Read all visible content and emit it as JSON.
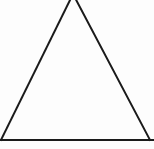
{
  "figure": {
    "kind": "geometry-diagram",
    "background_color": "#fdfdfd",
    "stroke_color": "#1a1a1a",
    "stroke_width": 2,
    "canvas": {
      "width": 154,
      "height": 149
    },
    "shapes": {
      "triangle": {
        "name": "isosceles-triangle",
        "apex": {
          "x": 73,
          "y": -6
        },
        "bottom_left": {
          "x": 1,
          "y": 140
        },
        "bottom_right": {
          "x": 150,
          "y": 140
        },
        "apex_clipped_at_top": true
      },
      "baseline": {
        "name": "horizontal-base-rule",
        "x1": 0,
        "y1": 140,
        "x2": 154,
        "y2": 140,
        "thickness": 2
      }
    },
    "margin_mark": {
      "name": "clipped-margin-glyph",
      "text": ",",
      "x": 0,
      "y": 56,
      "clipped_at_left_edge": true
    }
  }
}
